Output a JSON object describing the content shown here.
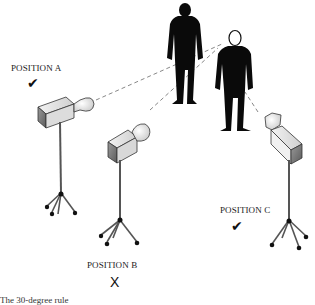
{
  "diagram": {
    "subjects": [
      {
        "id": "person-left",
        "description": "silhouette standing"
      },
      {
        "id": "person-right",
        "description": "silhouette standing, facing viewer"
      }
    ],
    "positions": [
      {
        "id": "A",
        "label": "POSITION A",
        "mark": "✔",
        "mark_meaning": "correct"
      },
      {
        "id": "B",
        "label": "POSITION B",
        "mark": "X",
        "mark_meaning": "incorrect"
      },
      {
        "id": "C",
        "label": "POSITION C",
        "mark": "✔",
        "mark_meaning": "correct"
      }
    ],
    "caption": "The 30-degree rule"
  }
}
